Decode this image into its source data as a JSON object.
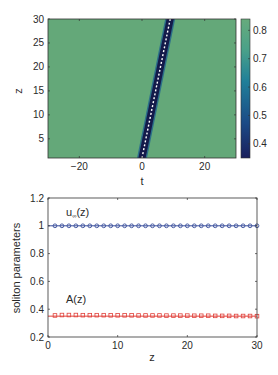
{
  "chart_data": [
    {
      "type": "heatmap",
      "title": "",
      "xlabel": "t",
      "ylabel": "z",
      "xlim": [
        -30,
        30
      ],
      "ylim": [
        1,
        30
      ],
      "xticks": [
        -20,
        0,
        20
      ],
      "yticks": [
        5,
        10,
        15,
        20,
        25,
        30
      ],
      "background_value": 0.82,
      "colorbar": {
        "range": [
          0.35,
          0.84
        ],
        "ticks": [
          0.4,
          0.5,
          0.6,
          0.7,
          0.8
        ],
        "colors": [
          "#1a1f5c",
          "#1b4a86",
          "#1f7f99",
          "#4aa189",
          "#67ab7c"
        ]
      },
      "soliton_track": {
        "description": "dark soliton trajectory (min ~0.35) with white dashed center line",
        "points": [
          {
            "z": 1,
            "t": 0
          },
          {
            "z": 30,
            "t": 9
          }
        ]
      }
    },
    {
      "type": "line",
      "title": "",
      "xlabel": "z",
      "ylabel": "soliton parameters",
      "xlim": [
        0,
        30
      ],
      "ylim": [
        0.2,
        1.2
      ],
      "xticks": [
        0,
        10,
        20,
        30
      ],
      "yticks": [
        0.2,
        0.4,
        0.6,
        0.8,
        1,
        1.2
      ],
      "grid": false,
      "series": [
        {
          "name": "u_∞(z)",
          "color": "#3a4f9c",
          "marker": "circle",
          "x": [
            1,
            2,
            3,
            4,
            5,
            6,
            7,
            8,
            9,
            10,
            11,
            12,
            13,
            14,
            15,
            16,
            17,
            18,
            19,
            20,
            21,
            22,
            23,
            24,
            25,
            26,
            27,
            28,
            29,
            30
          ],
          "values": [
            1,
            1,
            1,
            1,
            1,
            1,
            1,
            1,
            1,
            1,
            1,
            1,
            1,
            1,
            1,
            1,
            1,
            1,
            1,
            1,
            1,
            1,
            1,
            1,
            1,
            1,
            1,
            1,
            1,
            1
          ],
          "line_value": 1.0
        },
        {
          "name": "A(z)",
          "color": "#e0403a",
          "marker": "square",
          "x": [
            1,
            2,
            3,
            4,
            5,
            6,
            7,
            8,
            9,
            10,
            11,
            12,
            13,
            14,
            15,
            16,
            17,
            18,
            19,
            20,
            21,
            22,
            23,
            24,
            25,
            26,
            27,
            28,
            29,
            30
          ],
          "values": [
            0.355,
            0.358,
            0.358,
            0.358,
            0.357,
            0.357,
            0.357,
            0.357,
            0.356,
            0.356,
            0.356,
            0.356,
            0.355,
            0.355,
            0.355,
            0.355,
            0.354,
            0.354,
            0.354,
            0.354,
            0.353,
            0.353,
            0.353,
            0.352,
            0.352,
            0.352,
            0.351,
            0.351,
            0.351,
            0.35
          ],
          "line_value": 0.35
        }
      ],
      "annotations": [
        {
          "text": "u∞(z)",
          "x": 2,
          "y": 1.08
        },
        {
          "text": "A(z)",
          "x": 2,
          "y": 0.43
        }
      ]
    }
  ],
  "labels": {
    "top_xlabel": "t",
    "top_ylabel": "z",
    "bottom_xlabel": "z",
    "bottom_ylabel": "soliton parameters",
    "u_label_main": "u",
    "u_label_sub": "∞",
    "u_label_tail": "(z)",
    "a_label": "A(z)"
  }
}
